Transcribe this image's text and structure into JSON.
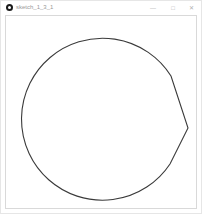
{
  "window": {
    "title": "sketch_1_3_1",
    "controls": {
      "minimize": "—",
      "maximize": "□",
      "close": "✕"
    }
  },
  "canvas": {
    "background": "#ffffff",
    "stroke_color": "#3a3a3a",
    "shape": {
      "type": "circle-with-right-spike",
      "center": [
        102,
        118
      ],
      "radius": 81,
      "spike_point": [
        187,
        127
      ]
    }
  }
}
